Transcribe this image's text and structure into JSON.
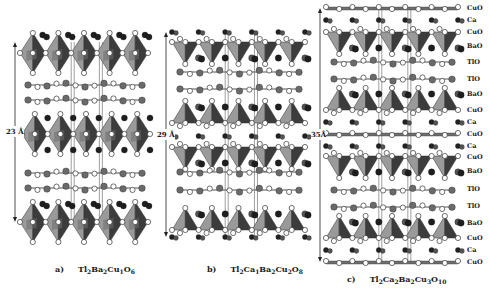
{
  "figure": {
    "panels": [
      {
        "id": "a",
        "label": "a)",
        "formula_parts": [
          [
            "Tl",
            "2"
          ],
          [
            "Ba",
            "2"
          ],
          [
            "Cu",
            "1"
          ],
          [
            "O",
            "6"
          ]
        ],
        "scale": "23 Å",
        "x0": 20,
        "x1": 148,
        "arrow_x": 15,
        "arrow_top": 42,
        "arrow_bottom": 222,
        "layers": [
          {
            "type": "octa",
            "y": 53
          },
          {
            "type": "tlo",
            "y": 85
          },
          {
            "type": "tlo",
            "y": 100
          },
          {
            "type": "octa",
            "y": 134,
            "shift": 1
          },
          {
            "type": "tlo",
            "y": 173
          },
          {
            "type": "tlo",
            "y": 188
          },
          {
            "type": "octa",
            "y": 222
          }
        ],
        "caption_x": 55,
        "caption_y": 264
      },
      {
        "id": "b",
        "label": "b)",
        "formula_parts": [
          [
            "Tl",
            "2"
          ],
          [
            "Ca",
            "1"
          ],
          [
            "Ba",
            "2"
          ],
          [
            "Cu",
            "2"
          ],
          [
            "O",
            "8"
          ]
        ],
        "scale": "29 Å",
        "x0": 172,
        "x1": 305,
        "arrow_x": 166,
        "arrow_top": 32,
        "arrow_bottom": 237,
        "layers": [
          {
            "type": "ca",
            "y": 32
          },
          {
            "type": "pyr_down",
            "y": 42
          },
          {
            "type": "tlo",
            "y": 72
          },
          {
            "type": "tlo",
            "y": 89
          },
          {
            "type": "pyr_up",
            "y": 123
          },
          {
            "type": "ca",
            "y": 136
          },
          {
            "type": "pyr_down",
            "y": 147
          },
          {
            "type": "tlo",
            "y": 172
          },
          {
            "type": "tlo",
            "y": 190
          },
          {
            "type": "pyr_up",
            "y": 230
          },
          {
            "type": "ca",
            "y": 237
          }
        ],
        "caption_x": 207,
        "caption_y": 264
      },
      {
        "id": "c",
        "label": "c)",
        "formula_parts": [
          [
            "Tl",
            "2"
          ],
          [
            "Ca",
            "2"
          ],
          [
            "Ba",
            "2"
          ],
          [
            "Cu",
            "3"
          ],
          [
            "O",
            "10"
          ]
        ],
        "scale": "35Å",
        "x0": 326,
        "x1": 458,
        "arrow_x": 320,
        "arrow_top": 8,
        "arrow_bottom": 262,
        "layers": [
          {
            "type": "cuo",
            "y": 8
          },
          {
            "type": "ca",
            "y": 20
          },
          {
            "type": "pyr_down",
            "y": 32
          },
          {
            "type": "tlo",
            "y": 62
          },
          {
            "type": "tlo",
            "y": 79
          },
          {
            "type": "pyr_up",
            "y": 110
          },
          {
            "type": "ca",
            "y": 122
          },
          {
            "type": "cuo",
            "y": 134
          },
          {
            "type": "ca",
            "y": 146
          },
          {
            "type": "pyr_down",
            "y": 156
          },
          {
            "type": "tlo",
            "y": 190
          },
          {
            "type": "tlo",
            "y": 207
          },
          {
            "type": "pyr_up",
            "y": 238
          },
          {
            "type": "ca",
            "y": 250
          },
          {
            "type": "cuo",
            "y": 262
          }
        ],
        "caption_x": 347,
        "caption_y": 274
      }
    ],
    "layer_labels": [
      {
        "text": "CuO",
        "y": 8
      },
      {
        "text": "Ca",
        "y": 20
      },
      {
        "text": "CuO",
        "y": 32
      },
      {
        "text": "BaO",
        "y": 46
      },
      {
        "text": "TlO",
        "y": 62
      },
      {
        "text": "TlO",
        "y": 79
      },
      {
        "text": "BaO",
        "y": 94
      },
      {
        "text": "CuO",
        "y": 110
      },
      {
        "text": "Ca",
        "y": 122
      },
      {
        "text": "CuO",
        "y": 134
      },
      {
        "text": "Ca",
        "y": 146
      },
      {
        "text": "CuO",
        "y": 157
      },
      {
        "text": "BaO",
        "y": 171
      },
      {
        "text": "TlO",
        "y": 189
      },
      {
        "text": "TlO",
        "y": 206
      },
      {
        "text": "BaO",
        "y": 223
      },
      {
        "text": "CuO",
        "y": 238
      },
      {
        "text": "Ca",
        "y": 250
      },
      {
        "text": "CuO",
        "y": 262
      }
    ]
  },
  "colors": {
    "polyhedron_light": "#9a9a9a",
    "polyhedron_mid": "#6e6e6e",
    "polyhedron_dark": "#3c3c3c",
    "oxygen_fill": "#ffffff",
    "atom_outline": "#333333",
    "ba_atom": "#1e1e1e",
    "tl_atom": "#6a6a6a",
    "ca_atom": "#222222",
    "unit_cell": "#777777"
  }
}
